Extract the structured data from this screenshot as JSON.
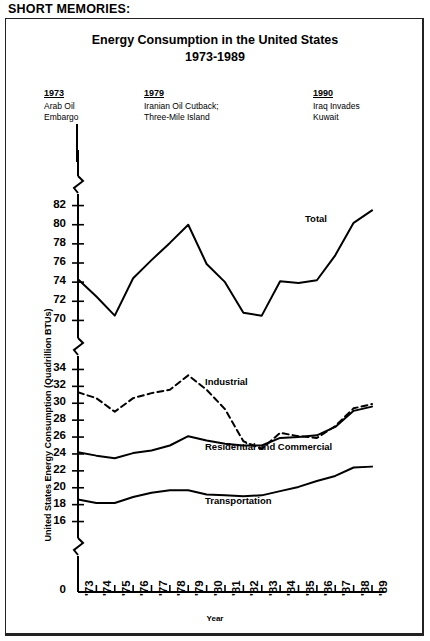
{
  "headline": {
    "line1": "SHORT MEMORIES:",
    "line2": "THE ENERGY ROLLER-COASTER"
  },
  "annotations": [
    {
      "year": "1973",
      "text": "Arab Oil\nEmbargo"
    },
    {
      "year": "1979",
      "text": "Iranian Oil Cutback;\nThree-Mile Island"
    },
    {
      "year": "1990",
      "text": "Iraq Invades\nKuwait"
    }
  ],
  "series_labels": {
    "total": "Total",
    "industrial": "Industrial",
    "residential": "Residential and Commercial",
    "transportation": "Transportation"
  },
  "chart_data": {
    "type": "line",
    "title": "Energy Consumption in the United States",
    "subtitle": "1973-1989",
    "xlabel": "Year",
    "ylabel": "United States Energy Consumption (Quadrillion BTUs)",
    "grid": false,
    "legend": "inline-labels",
    "axis_break": true,
    "categories": [
      "'73",
      "'74",
      "'75",
      "'76",
      "'77",
      "'78",
      "'79",
      "'80",
      "'81",
      "'82",
      "'83",
      "'84",
      "'85",
      "'86",
      "'87",
      "'88",
      "'89"
    ],
    "panels": [
      {
        "name": "upper",
        "ylim": [
          69,
          83
        ],
        "yticks": [
          70,
          72,
          74,
          76,
          78,
          80,
          82
        ],
        "series": [
          {
            "name": "Total",
            "style": "solid",
            "values": [
              74.3,
              72.5,
              70.5,
              74.4,
              76.3,
              78.1,
              80.0,
              75.9,
              74.0,
              70.8,
              70.5,
              74.1,
              73.9,
              74.2,
              76.8,
              80.2,
              81.5
            ]
          }
        ]
      },
      {
        "name": "lower",
        "ylim": [
          15,
          35
        ],
        "yticks": [
          16,
          18,
          20,
          22,
          24,
          26,
          28,
          30,
          32,
          34,
          0
        ],
        "series": [
          {
            "name": "Industrial",
            "style": "dashed",
            "values": [
              31.3,
              30.6,
              29.0,
              30.6,
              31.2,
              31.6,
              33.3,
              31.6,
              29.3,
              25.5,
              24.6,
              26.5,
              26.1,
              25.9,
              27.3,
              29.4,
              29.9
            ]
          },
          {
            "name": "Residential and Commercial",
            "style": "solid",
            "values": [
              24.2,
              23.8,
              23.5,
              24.1,
              24.4,
              25.0,
              26.1,
              25.6,
              25.2,
              25.0,
              25.0,
              25.9,
              26.0,
              26.2,
              27.2,
              29.1,
              29.6
            ]
          },
          {
            "name": "Transportation",
            "style": "solid",
            "values": [
              18.6,
              18.2,
              18.2,
              18.9,
              19.4,
              19.7,
              19.7,
              19.2,
              19.1,
              19.0,
              19.1,
              19.6,
              20.1,
              20.8,
              21.4,
              22.4,
              22.5
            ]
          }
        ]
      }
    ]
  }
}
